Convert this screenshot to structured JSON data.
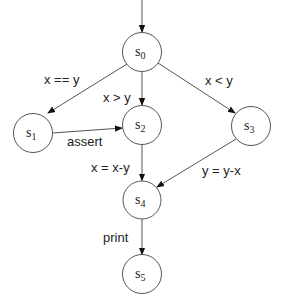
{
  "diagram": {
    "type": "state-transition-graph",
    "colors": {
      "line": "#555555",
      "text": "#222222",
      "node_fill": "#ffffff",
      "background": "#ffffff"
    },
    "nodes": [
      {
        "id": "s0",
        "label": "s",
        "sub": "0",
        "cx": 142,
        "cy": 52,
        "r": 19.5,
        "initial": true
      },
      {
        "id": "s1",
        "label": "s",
        "sub": "1",
        "cx": 33,
        "cy": 133,
        "r": 19.5
      },
      {
        "id": "s2",
        "label": "s",
        "sub": "2",
        "cx": 142,
        "cy": 125,
        "r": 19.5
      },
      {
        "id": "s3",
        "label": "s",
        "sub": "3",
        "cx": 251,
        "cy": 126,
        "r": 19.5
      },
      {
        "id": "s4",
        "label": "s",
        "sub": "4",
        "cx": 142,
        "cy": 200,
        "r": 19
      },
      {
        "id": "s5",
        "label": "s",
        "sub": "5",
        "cx": 142,
        "cy": 274,
        "r": 19.5
      }
    ],
    "edges": [
      {
        "from": "s0",
        "to": "s1",
        "label": "x == y"
      },
      {
        "from": "s0",
        "to": "s2",
        "label": "x > y"
      },
      {
        "from": "s0",
        "to": "s3",
        "label": "x < y"
      },
      {
        "from": "s1",
        "to": "s2",
        "label": "assert"
      },
      {
        "from": "s2",
        "to": "s4",
        "label": "x = x-y"
      },
      {
        "from": "s3",
        "to": "s4",
        "label": "y = y-x"
      },
      {
        "from": "s4",
        "to": "s5",
        "label": "print"
      }
    ]
  }
}
